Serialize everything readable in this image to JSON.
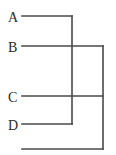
{
  "figure": {
    "kind": "cladogram",
    "background_color": "#ffffff",
    "line_color": "#4a4a4a",
    "label_color": "#2b2b2b",
    "line_width": 1.6,
    "width": 116,
    "height": 155
  },
  "taxa": [
    {
      "id": "A",
      "label": "A",
      "label_x": 8,
      "label_y": 22,
      "tip_x": 22,
      "tip_y": 16
    },
    {
      "id": "B",
      "label": "B",
      "label_x": 8,
      "label_y": 52,
      "tip_x": 22,
      "tip_y": 46
    },
    {
      "id": "C",
      "label": "C",
      "label_x": 8,
      "label_y": 102,
      "tip_x": 22,
      "tip_y": 96
    },
    {
      "id": "D",
      "label": "D",
      "label_x": 8,
      "label_y": 130,
      "tip_x": 22,
      "tip_y": 124
    }
  ],
  "chart_data": {
    "type": "diagram",
    "title": "",
    "tip_labels": [
      "A",
      "B",
      "C",
      "D"
    ],
    "tip_y": [
      16,
      46,
      96,
      124
    ],
    "clades": [
      {
        "name": "node-AD",
        "members": [
          "A",
          "D"
        ],
        "join_x": 72,
        "top_y": 16,
        "bottom_y": 124
      },
      {
        "name": "node-BC",
        "members": [
          "B",
          "C"
        ],
        "join_x": 103,
        "top_y": 46,
        "bottom_y": 96
      }
    ],
    "root": {
      "name": "root",
      "y": 149,
      "left_x": 22,
      "right_x": 103
    }
  },
  "segments": [
    {
      "name": "branch-A",
      "x1": 22,
      "y1": 16,
      "x2": 72,
      "y2": 16
    },
    {
      "name": "branch-B",
      "x1": 22,
      "y1": 46,
      "x2": 103,
      "y2": 46
    },
    {
      "name": "branch-C",
      "x1": 22,
      "y1": 96,
      "x2": 103,
      "y2": 96
    },
    {
      "name": "branch-D",
      "x1": 22,
      "y1": 124,
      "x2": 72,
      "y2": 124
    },
    {
      "name": "connector-AD",
      "x1": 72,
      "y1": 16,
      "x2": 72,
      "y2": 124
    },
    {
      "name": "connector-BC",
      "x1": 103,
      "y1": 46,
      "x2": 103,
      "y2": 149
    },
    {
      "name": "root-branch",
      "x1": 22,
      "y1": 149,
      "x2": 103,
      "y2": 149
    }
  ]
}
